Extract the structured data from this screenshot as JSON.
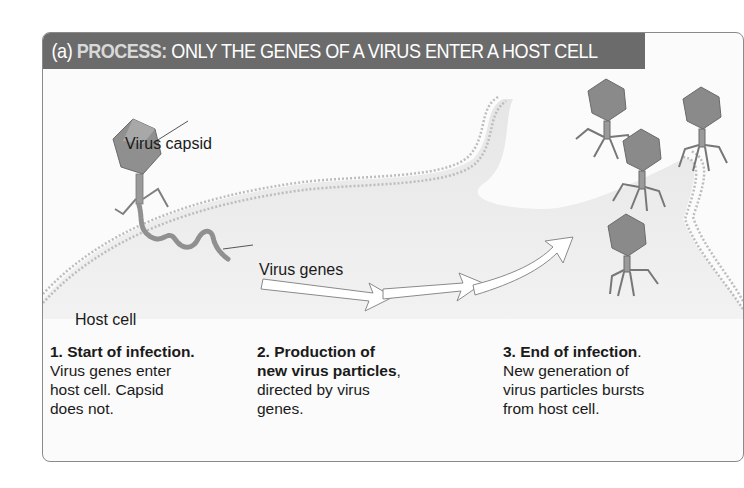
{
  "header": {
    "part_label": "(a)",
    "process_label": "PROCESS:",
    "title": "ONLY THE GENES OF A VIRUS ENTER A HOST CELL"
  },
  "diagram": {
    "labels": {
      "capsid": "Virus capsid",
      "genes": "Virus genes",
      "host_cell": "Host cell"
    },
    "colors": {
      "header_bg": "#6b6b6b",
      "process_text": "#d9d9d9",
      "cell_fill": "#ececec",
      "virus_fill": "#8c8c8c"
    }
  },
  "steps": [
    {
      "number_title": "1. Start of infection.",
      "bold_rest": "",
      "line1": "Virus genes enter",
      "line2": "host cell. Capsid",
      "line3": "does not."
    },
    {
      "number_title": "2. Production of",
      "bold_rest": "new virus particles",
      "line1_suffix": ",",
      "line2": "directed by virus",
      "line3": "genes."
    },
    {
      "number_title": "3. End of infection",
      "title_suffix": ".",
      "line1": "New generation of",
      "line2": "virus particles bursts",
      "line3": "from host cell."
    }
  ]
}
